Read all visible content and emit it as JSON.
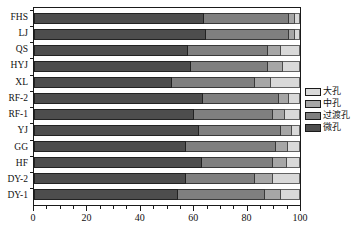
{
  "chart_data": {
    "type": "bar",
    "orientation": "horizontal",
    "stacked": true,
    "normalized_percent": true,
    "title": "",
    "xlabel": "",
    "ylabel": "",
    "xlim": [
      0,
      100
    ],
    "xticks": [
      0,
      20,
      40,
      60,
      80,
      100
    ],
    "xtick_labels": [
      "0",
      "20",
      "40",
      "60",
      "80",
      "100"
    ],
    "minor_tick_step": 5,
    "grid": false,
    "legend_position": "right",
    "categories": [
      "FHS",
      "LJ",
      "QS",
      "HYJ",
      "XL",
      "RF-2",
      "RF-1",
      "YJ",
      "GG",
      "HF",
      "DY-2",
      "DY-1"
    ],
    "series": [
      {
        "name": "微孔",
        "color": "#4d4d4d",
        "values": [
          64.0,
          64.5,
          58.0,
          59.0,
          52.0,
          63.5,
          60.0,
          62.0,
          57.0,
          63.0,
          57.0,
          54.0
        ]
      },
      {
        "name": "过渡孔",
        "color": "#7f7f7f",
        "values": [
          32.0,
          31.5,
          30.0,
          29.0,
          31.0,
          28.5,
          30.0,
          31.0,
          34.0,
          27.0,
          26.0,
          33.0
        ]
      },
      {
        "name": "中孔",
        "color": "#a6a6a6",
        "values": [
          2.0,
          2.0,
          5.0,
          5.5,
          6.0,
          4.0,
          4.5,
          4.0,
          4.5,
          5.0,
          7.0,
          6.0
        ]
      },
      {
        "name": "大孔",
        "color": "#d9d9d9",
        "values": [
          2.0,
          2.0,
          7.0,
          6.5,
          11.0,
          4.0,
          5.5,
          3.0,
          4.5,
          5.0,
          10.0,
          7.0
        ]
      }
    ]
  },
  "legend": {
    "items": [
      {
        "label": "大孔",
        "color": "#d9d9d9"
      },
      {
        "label": "中孔",
        "color": "#a6a6a6"
      },
      {
        "label": "过渡孔",
        "color": "#7f7f7f"
      },
      {
        "label": "微孔",
        "color": "#4d4d4d"
      }
    ]
  },
  "axis": {
    "x_tick_labels": [
      "0",
      "20",
      "40",
      "60",
      "80",
      "100"
    ],
    "y_category_labels": [
      "FHS",
      "LJ",
      "QS",
      "HYJ",
      "XL",
      "RF-2",
      "RF-1",
      "YJ",
      "GG",
      "HF",
      "DY-2",
      "DY-1"
    ]
  },
  "colors": {
    "frame": "#1a1a1a",
    "background": "#ffffff",
    "text": "#111111"
  }
}
